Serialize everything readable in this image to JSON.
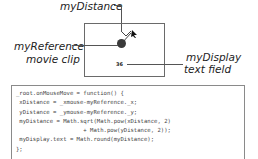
{
  "labels": {
    "distance": "myDistance",
    "reference_line1": "myReference",
    "reference_line2": "movie clip",
    "display_line1": "myDisplay",
    "display_line2": "text field"
  },
  "stage": {
    "display_value": "36"
  },
  "code": {
    "lines": [
      "_root.onMouseMove = function() {",
      " xDistance = _xmouse-myReference._x;",
      " yDistance = _ymouse-myReference._y;",
      " myDistance = Math.sqrt(Math.pow(xDistance, 2)",
      "                    + Math.pow(yDistance, 2));",
      " myDisplay.text = Math.round(myDistance);",
      "};"
    ]
  }
}
